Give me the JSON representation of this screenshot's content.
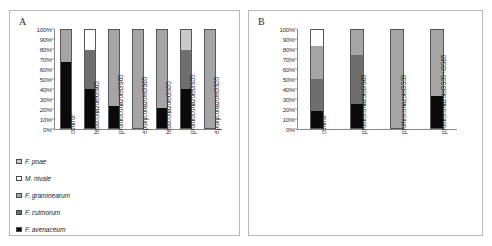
{
  "figure": {
    "panels": [
      {
        "id": "A",
        "label": "A"
      },
      {
        "id": "B",
        "label": "B"
      }
    ]
  },
  "legend": {
    "items": [
      {
        "label": "F. poae",
        "color": "#c9c9c9"
      },
      {
        "label": "M. nivale",
        "color": "#ffffff"
      },
      {
        "label": "F. graminearum",
        "color": "#a5a5a5"
      },
      {
        "label": "F. culmorum",
        "color": "#6e6e6e"
      },
      {
        "label": "F. avenaceum",
        "color": "#0a0a0a"
      }
    ]
  },
  "axis": {
    "yticks": [
      "100%",
      "90%",
      "80%",
      "70%",
      "60%",
      "50%",
      "40%",
      "30%",
      "20%",
      "10%",
      "0%"
    ],
    "ymin": 0,
    "ymax": 100
  },
  "chart_data": [
    {
      "type": "bar",
      "panel": "A",
      "title": "A",
      "stacked": true,
      "normalized": true,
      "xlabel": "",
      "ylabel": "",
      "ylim": [
        0,
        100
      ],
      "ytick_labels": [
        "0%",
        "10%",
        "20%",
        "30%",
        "40%",
        "50%",
        "60%",
        "70%",
        "80%",
        "90%",
        "100%"
      ],
      "grid": false,
      "legend_position": "bottom-left",
      "categories": [
        "control",
        "tebuconazoleGS65",
        "prothioconazoleGS65",
        "epoxyconazoleGS65",
        "tebuconazoleGS55",
        "prothioconazoleGS55",
        "epoxyconazoleGS55"
      ],
      "series": [
        {
          "name": "F. avenaceum",
          "color": "#0a0a0a",
          "values": [
            67,
            40,
            22,
            0,
            20,
            40,
            0
          ]
        },
        {
          "name": "F. culmorum",
          "color": "#6e6e6e",
          "values": [
            0,
            40,
            0,
            0,
            0,
            40,
            0
          ]
        },
        {
          "name": "F. graminearum",
          "color": "#a5a5a5",
          "values": [
            33,
            0,
            78,
            100,
            80,
            0,
            100
          ]
        },
        {
          "name": "M. nivale",
          "color": "#ffffff",
          "values": [
            0,
            20,
            0,
            0,
            0,
            0,
            0
          ]
        },
        {
          "name": "F. poae",
          "color": "#c9c9c9",
          "values": [
            0,
            0,
            0,
            0,
            0,
            20,
            0
          ]
        }
      ]
    },
    {
      "type": "bar",
      "panel": "B",
      "title": "B",
      "stacked": true,
      "normalized": true,
      "xlabel": "",
      "ylabel": "",
      "ylim": [
        0,
        100
      ],
      "ytick_labels": [
        "0%",
        "10%",
        "20%",
        "30%",
        "40%",
        "50%",
        "60%",
        "70%",
        "80%",
        "90%",
        "100%"
      ],
      "grid": false,
      "legend_position": "shared-with-panel-A",
      "categories": [
        "control",
        "prothioconazoleGS65",
        "prothioconazoleGS39",
        "prothioconazoleGS39+GS65"
      ],
      "series": [
        {
          "name": "F. avenaceum",
          "color": "#0a0a0a",
          "values": [
            17,
            25,
            0,
            33
          ]
        },
        {
          "name": "F. culmorum",
          "color": "#6e6e6e",
          "values": [
            33,
            49,
            0,
            0
          ]
        },
        {
          "name": "F. graminearum",
          "color": "#a5a5a5",
          "values": [
            34,
            26,
            100,
            67
          ]
        },
        {
          "name": "M. nivale",
          "color": "#ffffff",
          "values": [
            16,
            0,
            0,
            0
          ]
        },
        {
          "name": "F. poae",
          "color": "#c9c9c9",
          "values": [
            0,
            0,
            0,
            0
          ]
        }
      ]
    }
  ]
}
